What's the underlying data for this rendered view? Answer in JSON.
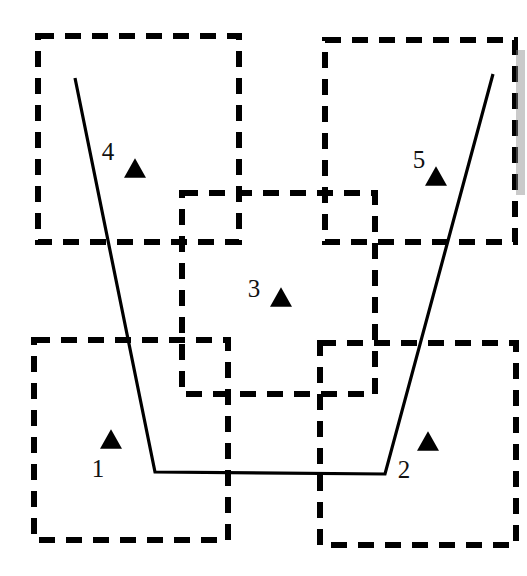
{
  "figure": {
    "title": "",
    "width": 527,
    "height": 576,
    "background_color": "#ffffff",
    "stroke_color": "#000000",
    "label_color": "#111111",
    "marker_color": "#000000",
    "marker_shape": "triangle-up",
    "box_style": "dashed",
    "box_stroke_width": 6,
    "box_dash_pattern": "16 11",
    "polyline_stroke_width": 3.2
  },
  "nodes": [
    {
      "id": "node-1",
      "label": "1",
      "label_x": 98,
      "label_y": 477,
      "marker_x": 111,
      "marker_y": 439,
      "marker_size": 22,
      "box": {
        "x": 34,
        "y": 340,
        "width": 194,
        "height": 200
      }
    },
    {
      "id": "node-2",
      "label": "2",
      "label_x": 404,
      "label_y": 478,
      "marker_x": 428,
      "marker_y": 441,
      "marker_size": 22,
      "box": {
        "x": 320,
        "y": 343,
        "width": 196,
        "height": 202
      }
    },
    {
      "id": "node-3",
      "label": "3",
      "label_x": 254,
      "label_y": 297,
      "marker_x": 281,
      "marker_y": 297,
      "marker_size": 22,
      "box": {
        "x": 182,
        "y": 193,
        "width": 193,
        "height": 201
      }
    },
    {
      "id": "node-4",
      "label": "4",
      "label_x": 108,
      "label_y": 160,
      "marker_x": 135,
      "marker_y": 168,
      "marker_size": 22,
      "box": {
        "x": 38,
        "y": 36,
        "width": 201,
        "height": 206
      }
    },
    {
      "id": "node-5",
      "label": "5",
      "label_x": 419,
      "label_y": 168,
      "marker_x": 436,
      "marker_y": 176,
      "marker_size": 22,
      "box": {
        "x": 325,
        "y": 40,
        "width": 190,
        "height": 202
      }
    }
  ],
  "polyline": {
    "id": "trajectory-polyline",
    "points": "75,78 155,472 385,474 493,74"
  },
  "artifacts": [
    {
      "id": "scan-edge-smudge",
      "x": 516,
      "y": 50,
      "width": 9,
      "height": 145,
      "color": "#8a8a8a"
    }
  ]
}
